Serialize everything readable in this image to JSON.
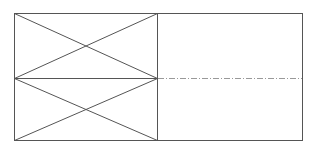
{
  "diagram": {
    "type": "technical-drawing",
    "colors": {
      "stroke": "#555555",
      "centerline": "#999999",
      "background": "#ffffff"
    },
    "outer_rect": {
      "x": 14,
      "y": 13,
      "width": 288,
      "height": 127
    },
    "divider_x": 157,
    "centerline_y": 78,
    "panels": [
      {
        "name": "upper-left-panel",
        "x1": 14,
        "y1": 13,
        "x2": 157,
        "y2": 78,
        "crossed": true
      },
      {
        "name": "lower-left-panel",
        "x1": 14,
        "y1": 78,
        "x2": 157,
        "y2": 140,
        "crossed": true
      },
      {
        "name": "right-panel",
        "x1": 157,
        "y1": 13,
        "x2": 302,
        "y2": 140,
        "crossed": false
      }
    ]
  }
}
